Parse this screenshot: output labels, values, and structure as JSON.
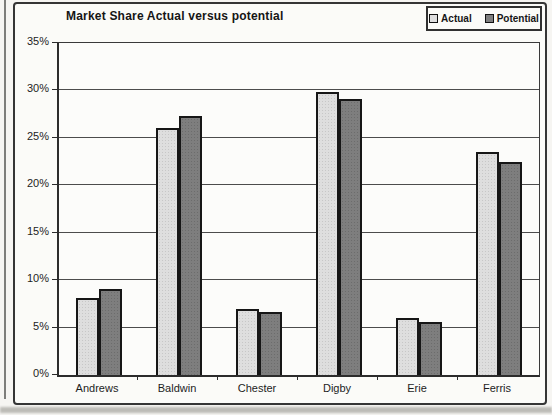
{
  "chart_data": {
    "type": "bar",
    "title": "Market Share Actual versus potential",
    "categories": [
      "Andrews",
      "Baldwin",
      "Chester",
      "Digby",
      "Erie",
      "Ferris"
    ],
    "series": [
      {
        "name": "Actual",
        "color": "#dedede",
        "values": [
          8.1,
          26.0,
          7.0,
          29.8,
          6.0,
          23.5
        ]
      },
      {
        "name": "Potential",
        "color": "#7e7e7e",
        "values": [
          9.1,
          27.3,
          6.6,
          29.1,
          5.6,
          22.5
        ]
      }
    ],
    "xlabel": "",
    "ylabel": "",
    "ylim": [
      0,
      35
    ],
    "ytick_step": 5,
    "ytick_labels": [
      "0%",
      "5%",
      "10%",
      "15%",
      "20%",
      "25%",
      "30%",
      "35%"
    ],
    "grid": true,
    "legend_position": "top-right"
  }
}
